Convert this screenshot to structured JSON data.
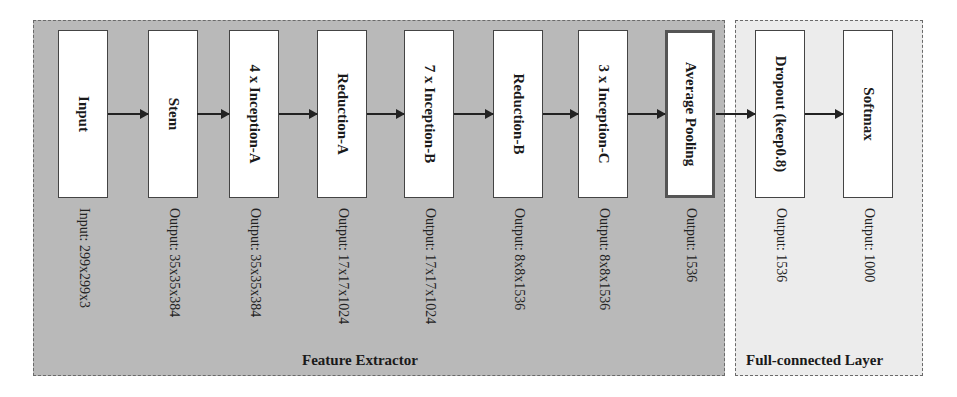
{
  "diagram": {
    "groups": {
      "feature_extractor": {
        "label": "Feature Extractor"
      },
      "fully_connected": {
        "label": "Full-connected Layer"
      }
    },
    "blocks": [
      {
        "label": "Input",
        "output": "Input: 299x299x3"
      },
      {
        "label": "Stem",
        "output": "Output: 35x35x384"
      },
      {
        "label": "4 x Inception-A",
        "output": "Output: 35x35x384"
      },
      {
        "label": "Reduction-A",
        "output": "Output: 17x17x1024"
      },
      {
        "label": "7 x Inception-B",
        "output": "Output: 17x17x1024"
      },
      {
        "label": "Reduction-B",
        "output": "Output: 8x8x1536"
      },
      {
        "label": "3 x Inception-C",
        "output": "Output: 8x8x1536"
      },
      {
        "label": "Average Pooling",
        "output": "Output: 1536"
      },
      {
        "label": "Dropout (keep0.8)",
        "output": "Output: 1536"
      },
      {
        "label": "Softmax",
        "output": "Output: 1000"
      }
    ],
    "colors": {
      "feature_extractor_bg": "#b9b9b9",
      "fully_connected_bg": "#ececec",
      "block_bg": "#ffffff"
    }
  }
}
